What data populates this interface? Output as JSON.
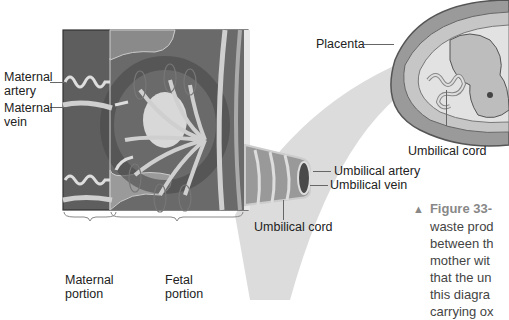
{
  "labels": {
    "maternal_artery": [
      "Maternal",
      "artery"
    ],
    "maternal_vein": [
      "Maternal",
      "vein"
    ],
    "placenta": "Placenta",
    "umbilical_cord_top": "Umbilical cord",
    "umbilical_artery": "Umbilical artery",
    "umbilical_vein": "Umbilical vein",
    "umbilical_cord_bottom": "Umbilical cord",
    "maternal_portion": [
      "Maternal",
      "portion"
    ],
    "fetal_portion": [
      "Fetal",
      "portion"
    ]
  },
  "caption": {
    "marker": "▲",
    "figure": "Figure 33-",
    "lines": [
      "waste prod",
      "between th",
      "mother wit",
      "that the un",
      "this diagra",
      "carrying ox"
    ]
  },
  "colors": {
    "maternal_tissue": "#5a5a5a",
    "fetal_tissue": "#8c8c8c",
    "vessel_light": "#d4d4d4",
    "vessel_dark": "#6e6e6e",
    "connector_band": "#cfcfcf",
    "caption_accent": "#8a8a8a"
  }
}
